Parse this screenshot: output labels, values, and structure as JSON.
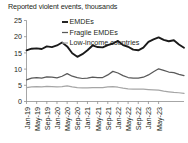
{
  "chart_data": {
    "type": "line",
    "title": "Reported violent events, thousands",
    "xlabel": "",
    "ylabel": "",
    "ylim": [
      0,
      25
    ],
    "yticks": [
      0,
      5,
      10,
      15,
      20,
      25
    ],
    "grid": false,
    "legend_position": "top-center",
    "categories": [
      "Jan-19",
      "Mar-19",
      "May-19",
      "Jul-19",
      "Sep-19",
      "Nov-19",
      "Jan-20",
      "Mar-20",
      "May-20",
      "Jul-20",
      "Sep-20",
      "Nov-20",
      "Jan-21",
      "Mar-21",
      "May-21",
      "Jul-21",
      "Sep-21",
      "Nov-21",
      "Jan-22",
      "Mar-22",
      "May-22",
      "Jul-22",
      "Sep-22",
      "Nov-22",
      "Jan-23",
      "Mar-23",
      "May-23"
    ],
    "xtick_labels": [
      "Jan-19",
      "May-19",
      "Sep-19",
      "Jan-20",
      "May-20",
      "Sep-20",
      "Jan-21",
      "May-21",
      "Sep-21",
      "Jan-22",
      "May-22",
      "Sep-22",
      "Jan-23",
      "May-23"
    ],
    "series": [
      {
        "name": "EMDEs",
        "color": "#1a1a1a",
        "width": 1.9,
        "values": [
          15.8,
          16.3,
          16.4,
          16.2,
          17.0,
          16.8,
          17.3,
          18.2,
          17.0,
          14.9,
          13.8,
          14.6,
          15.8,
          17.3,
          16.8,
          16.7,
          17.4,
          17.9,
          18.7,
          17.4,
          16.9,
          16.0,
          15.8,
          16.6,
          18.4,
          19.2,
          19.8
        ]
      },
      {
        "name": "Fragile EMDEs",
        "color": "#595959",
        "width": 1.25,
        "values": [
          6.7,
          7.2,
          7.4,
          7.2,
          7.6,
          7.5,
          7.3,
          7.8,
          8.6,
          7.8,
          7.4,
          7.1,
          7.2,
          7.5,
          7.4,
          7.4,
          8.2,
          9.3,
          8.8,
          8.0,
          7.4,
          7.2,
          7.2,
          7.5,
          8.2,
          9.2,
          10.1
        ]
      },
      {
        "name": "Low-income countries",
        "color": "#a6a6a6",
        "width": 1.25,
        "values": [
          4.3,
          4.5,
          4.6,
          4.5,
          4.7,
          4.6,
          4.5,
          4.6,
          4.8,
          4.5,
          4.3,
          4.2,
          4.2,
          4.3,
          4.3,
          4.3,
          4.5,
          4.6,
          4.4,
          4.1,
          3.9,
          3.8,
          3.8,
          3.8,
          3.7,
          3.6,
          3.5
        ]
      }
    ],
    "series_tail": {
      "note": "trailing values continue to right edge",
      "EMDEs": [
        19.8,
        19.0,
        18.6,
        18.9,
        17.6,
        16.6
      ],
      "Fragile EMDEs": [
        10.2,
        9.6,
        9.1,
        8.9,
        8.4,
        8.0
      ],
      "Low-income countries": [
        3.4,
        3.2,
        3.0,
        2.8,
        2.7,
        2.5
      ]
    }
  },
  "legend": {
    "items": [
      {
        "label": "EMDEs",
        "color": "#1a1a1a"
      },
      {
        "label": "Fragile EMDEs",
        "color": "#595959"
      },
      {
        "label": "Low-income countries",
        "color": "#a6a6a6"
      }
    ]
  },
  "axis": {
    "y_tick_labels": [
      "25",
      "20",
      "15",
      "10",
      "5",
      "0"
    ]
  }
}
